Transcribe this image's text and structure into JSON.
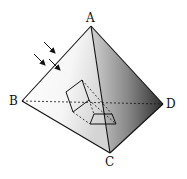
{
  "diagram": {
    "vertices": {
      "A": {
        "label": "A",
        "x": 91,
        "y": 26
      },
      "B": {
        "label": "B",
        "x": 22,
        "y": 101
      },
      "C": {
        "label": "C",
        "x": 110,
        "y": 153
      },
      "D": {
        "label": "D",
        "x": 163,
        "y": 104
      }
    },
    "colors": {
      "edge": "#111111",
      "face_left_light": "#ffffff",
      "face_left_dark": "#d8d8d8",
      "face_right_light": "#c8c8c8",
      "face_right_dark": "#3a3a3a"
    },
    "arrows_count": 3
  }
}
